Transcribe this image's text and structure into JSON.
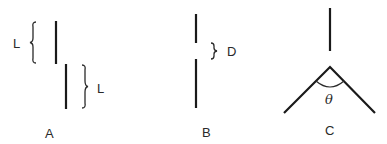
{
  "diagram": {
    "panels": [
      {
        "id": "A",
        "caption": "A",
        "description": "Two offset parallel vertical segments each of length L",
        "labels": {
          "upper_length": "L",
          "lower_length": "L"
        }
      },
      {
        "id": "B",
        "caption": "B",
        "description": "Two collinear vertical segments separated by gap D",
        "labels": {
          "gap": "D"
        }
      },
      {
        "id": "C",
        "caption": "C",
        "description": "Vertical segment above an inverted-V with apex angle theta",
        "labels": {
          "angle": "θ"
        }
      }
    ],
    "colors": {
      "ink": "#1a1a1a",
      "background": "#ffffff"
    }
  }
}
